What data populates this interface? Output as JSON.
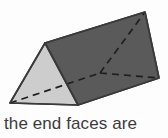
{
  "figure": {
    "name": "triangular-prism-diagram",
    "colors": {
      "background": "#fdfdfd",
      "front_triangle_face": "#cdcdcd",
      "top_rectangular_face": "#5a5a5a",
      "outline": "#3a3a3a",
      "hidden_edge": "#1f1f1f",
      "caption_text": "#3b3b3b"
    },
    "vertices": {
      "front_apex": [
        45,
        43
      ],
      "front_bottom_left": [
        10,
        103
      ],
      "front_bottom_right": [
        78,
        105
      ],
      "back_apex": [
        145,
        12
      ],
      "back_bottom_left": [
        100,
        73
      ],
      "back_bottom_right": [
        159,
        78
      ]
    },
    "visible_edges": [
      "front_apex-front_bottom_left",
      "front_apex-front_bottom_right",
      "front_bottom_left-front_bottom_right",
      "front_apex-back_apex",
      "front_bottom_right-back_bottom_right",
      "back_apex-back_bottom_right"
    ],
    "hidden_edges": [
      "front_bottom_left-back_bottom_left",
      "back_bottom_left-back_apex",
      "back_bottom_left-back_bottom_right"
    ],
    "faces": [
      {
        "id": "front-triangle-face",
        "shade": "light"
      },
      {
        "id": "top-slope-face",
        "shade": "dark"
      },
      {
        "id": "right-end-face",
        "shade": "dark"
      }
    ]
  },
  "caption": {
    "text": "the end faces are"
  }
}
